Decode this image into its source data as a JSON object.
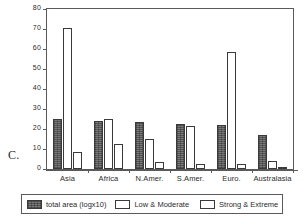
{
  "panel": {
    "letter": "C."
  },
  "chart_data": {
    "type": "bar",
    "title": "",
    "xlabel": "",
    "ylabel": "million hectares",
    "ylim": [
      0,
      80
    ],
    "ytick_step": 10,
    "yticks": [
      "0",
      "10",
      "20",
      "30",
      "40",
      "50",
      "60",
      "70",
      "80"
    ],
    "grid": false,
    "legend_position": "bottom",
    "categories": [
      "Asia",
      "Africa",
      "N.Amer.",
      "S.Amer.",
      "Euro.",
      "Australasia"
    ],
    "series": [
      {
        "name": "total area (logx10)",
        "fill": "hatched-gray",
        "color": "#7a7a7a",
        "values": [
          25,
          24,
          23.5,
          22.5,
          22,
          17
        ]
      },
      {
        "name": "Low & Moderate",
        "fill": "white",
        "color": "#ffffff",
        "values": [
          70.5,
          25,
          15,
          21.5,
          58.5,
          4
        ]
      },
      {
        "name": "Strong & Extreme",
        "fill": "dotted",
        "color": "#ffffff",
        "values": [
          8.5,
          12.5,
          3.5,
          2.5,
          2.5,
          1
        ]
      }
    ]
  },
  "legend": {
    "items": [
      {
        "label": "total area (logx10)"
      },
      {
        "label": "Low & Moderate"
      },
      {
        "label": "Strong & Extreme"
      }
    ]
  }
}
